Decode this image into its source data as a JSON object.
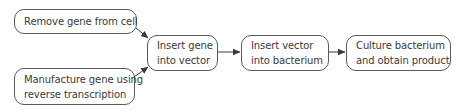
{
  "diagram": {
    "type": "flowchart",
    "colors": {
      "border": "#5a5a5a",
      "text": "#3a3a3a",
      "arrow": "#3a3a3a",
      "background": "#ffffff"
    },
    "nodes": [
      {
        "id": "remove-gene",
        "lines": [
          "Remove gene from cell"
        ]
      },
      {
        "id": "manufacture-gene",
        "lines": [
          "Manufacture gene using",
          "reverse transcription"
        ]
      },
      {
        "id": "insert-gene",
        "lines": [
          "Insert gene",
          "into vector"
        ]
      },
      {
        "id": "insert-vector",
        "lines": [
          "Insert vector",
          "into bacterium"
        ]
      },
      {
        "id": "culture-bacterium",
        "lines": [
          "Culture bacterium",
          "and obtain product"
        ]
      }
    ],
    "edges": [
      {
        "from": "remove-gene",
        "to": "insert-gene"
      },
      {
        "from": "manufacture-gene",
        "to": "insert-gene"
      },
      {
        "from": "insert-gene",
        "to": "insert-vector"
      },
      {
        "from": "insert-vector",
        "to": "culture-bacterium"
      }
    ]
  }
}
